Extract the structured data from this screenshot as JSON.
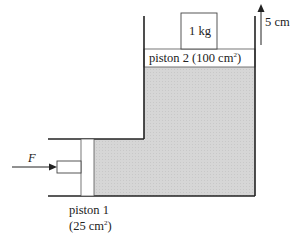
{
  "diagram": {
    "type": "hydraulic-press",
    "mass_label": "1 kg",
    "height_label": "5 cm",
    "piston2": {
      "label": "piston 2 (100 cm",
      "unit_sup": "2",
      "close": ")"
    },
    "piston1": {
      "line1": "piston 1",
      "line2_open": "(25 cm",
      "unit_sup": "2",
      "line2_close": ")"
    },
    "force_label": "F",
    "colors": {
      "fluid": "#d8d8d8",
      "line": "#222222",
      "piston": "#ffffff"
    }
  }
}
